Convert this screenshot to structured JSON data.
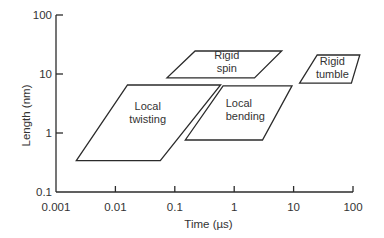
{
  "chart_data": {
    "type": "area",
    "title": "",
    "xlabel": "Time (µs)",
    "ylabel": "Length (nm)",
    "xscale": "log",
    "yscale": "log",
    "xlim": [
      0.001,
      100
    ],
    "ylim": [
      0.1,
      100
    ],
    "grid": false,
    "legend": "none",
    "xticks": [
      {
        "value": 0.001,
        "label": "0.001"
      },
      {
        "value": 0.01,
        "label": "0.01"
      },
      {
        "value": 0.1,
        "label": "0.1"
      },
      {
        "value": 1,
        "label": "1"
      },
      {
        "value": 10,
        "label": "10"
      },
      {
        "value": 100,
        "label": "100"
      }
    ],
    "yticks": [
      {
        "value": 0.1,
        "label": "0.1"
      },
      {
        "value": 1,
        "label": "1"
      },
      {
        "value": 10,
        "label": "10"
      },
      {
        "value": 100,
        "label": "100"
      }
    ],
    "regions": [
      {
        "name": "local-twisting",
        "label_lines": [
          "Local",
          "twisting"
        ],
        "vertices": [
          [
            0.0022,
            0.34
          ],
          [
            0.057,
            0.34
          ],
          [
            0.59,
            6.5
          ],
          [
            0.016,
            6.5
          ]
        ],
        "label_at": [
          0.035,
          2.2
        ],
        "label_align": "middle"
      },
      {
        "name": "local-bending",
        "label_lines": [
          "Local",
          "bending"
        ],
        "vertices": [
          [
            0.15,
            0.76
          ],
          [
            3.0,
            0.76
          ],
          [
            9.4,
            6.3
          ],
          [
            0.65,
            6.3
          ]
        ],
        "label_at": [
          0.72,
          2.5
        ],
        "label_align": "start"
      },
      {
        "name": "rigid-spin",
        "label_lines": [
          "Rigid",
          "spin"
        ],
        "vertices": [
          [
            0.074,
            8.6
          ],
          [
            2.2,
            8.6
          ],
          [
            6.3,
            24.5
          ],
          [
            0.22,
            24.5
          ]
        ],
        "label_at": [
          0.75,
          16
        ],
        "label_align": "middle"
      },
      {
        "name": "rigid-tumble",
        "label_lines": [
          "Rigid",
          "tumble"
        ],
        "vertices": [
          [
            12.6,
            7.0
          ],
          [
            94,
            7.0
          ],
          [
            130,
            21
          ],
          [
            25,
            21
          ]
        ],
        "label_at": [
          45,
          13
        ],
        "label_align": "middle"
      }
    ]
  }
}
